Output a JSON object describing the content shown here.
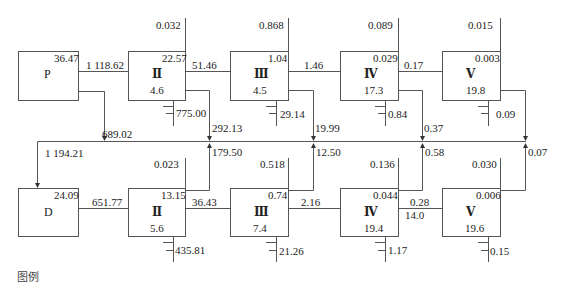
{
  "diagram": {
    "legend_label": "图例",
    "top_row": {
      "source": {
        "name": "P",
        "corner_value": "36.47"
      },
      "stages": [
        {
          "name": "Ⅱ",
          "corner_value": "22.57",
          "bottom_value": "4.6",
          "top_line_value": "0.032",
          "settle_value": "775.00",
          "return_value": "292.13"
        },
        {
          "name": "Ⅲ",
          "corner_value": "1.04",
          "bottom_value": "4.5",
          "top_line_value": "0.868",
          "settle_value": "29.14",
          "return_value": "19.99"
        },
        {
          "name": "Ⅳ",
          "corner_value": "0.029",
          "bottom_value": "17.3",
          "top_line_value": "0.089",
          "settle_value": "0.84",
          "return_value": "0.37"
        },
        {
          "name": "Ⅴ",
          "corner_value": "0.003",
          "bottom_value": "19.8",
          "top_line_value": "0.015",
          "settle_value": "0.09",
          "return_value": ""
        }
      ],
      "links": [
        "1 118.62",
        "51.46",
        "1.46",
        "0.17"
      ],
      "source_branch_value": "689.02"
    },
    "bottom_row": {
      "source": {
        "name": "D",
        "corner_value": "24.09",
        "inflow_value": "1 194.21"
      },
      "stages": [
        {
          "name": "Ⅱ",
          "corner_value": "13.15",
          "bottom_value": "5.6",
          "top_line_value": "0.023",
          "settle_value": "435.81",
          "return_value": "179.50"
        },
        {
          "name": "Ⅲ",
          "corner_value": "0.74",
          "bottom_value": "7.4",
          "top_line_value": "0.518",
          "settle_value": "21.26",
          "return_value": "12.50"
        },
        {
          "name": "Ⅳ",
          "corner_value": "0.044",
          "bottom_value": "19.4",
          "top_line_value": "0.136",
          "settle_value": "1.17",
          "return_value": "0.58"
        },
        {
          "name": "Ⅴ",
          "corner_value": "0.006",
          "bottom_value": "19.6",
          "top_line_value": "0.030",
          "settle_value": "0.15",
          "return_value": "0.07"
        }
      ],
      "links": [
        "651.77",
        "36.43",
        "2.16",
        "0.28"
      ],
      "link_sub_value": "14.0"
    }
  }
}
